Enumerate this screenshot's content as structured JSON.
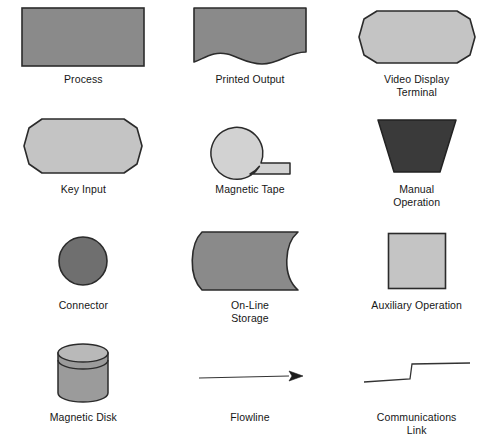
{
  "diagram": {
    "background_color": "#ffffff",
    "text_color": "#161616",
    "stroke_color": "#2b2b2b",
    "palette": {
      "medium_gray": "#8a8a8a",
      "light_gray": "#c4c4c4",
      "dark_gray": "#3a3a3a",
      "cylinder_top": "#b9b9b9",
      "cylinder_body": "#9b9b9b",
      "line": "#333333"
    },
    "columns": 3,
    "rows": 4,
    "symbols": [
      {
        "id": "process",
        "label": "Process",
        "shape": "rectangle",
        "fill": "#8a8a8a",
        "row": 1,
        "column": 1
      },
      {
        "id": "printed-output",
        "label": "Printed Output",
        "shape": "document-wavy-bottom",
        "fill": "#8a8a8a",
        "row": 1,
        "column": 2
      },
      {
        "id": "video-display-terminal",
        "label": "Video Display\nTerminal",
        "shape": "chamfered-rounded-rectangle",
        "fill": "#c4c4c4",
        "row": 1,
        "column": 3
      },
      {
        "id": "key-input",
        "label": "Key Input",
        "shape": "chamfered-rounded-rectangle",
        "fill": "#c4c4c4",
        "row": 2,
        "column": 1
      },
      {
        "id": "magnetic-tape",
        "label": "Magnetic Tape",
        "shape": "circle-with-tail",
        "fill": "#d2d2d2",
        "row": 2,
        "column": 2
      },
      {
        "id": "manual-operation",
        "label": "Manual\nOperation",
        "shape": "trapezoid",
        "fill": "#3a3a3a",
        "row": 2,
        "column": 3
      },
      {
        "id": "connector",
        "label": "Connector",
        "shape": "circle",
        "fill": "#6f6f6f",
        "row": 3,
        "column": 1
      },
      {
        "id": "on-line-storage",
        "label": "On-Line\nStorage",
        "shape": "convex-left-concave-right",
        "fill": "#8a8a8a",
        "row": 3,
        "column": 2
      },
      {
        "id": "auxiliary-operation",
        "label": "Auxiliary Operation",
        "shape": "square",
        "fill": "#c4c4c4",
        "row": 3,
        "column": 3
      },
      {
        "id": "magnetic-disk",
        "label": "Magnetic Disk",
        "shape": "cylinder",
        "fill": "#9b9b9b",
        "row": 4,
        "column": 1
      },
      {
        "id": "flowline",
        "label": "Flowline",
        "shape": "arrow",
        "fill": "none",
        "row": 4,
        "column": 2
      },
      {
        "id": "communications-link",
        "label": "Communications\nLink",
        "shape": "step-line",
        "fill": "none",
        "row": 4,
        "column": 3
      }
    ]
  }
}
